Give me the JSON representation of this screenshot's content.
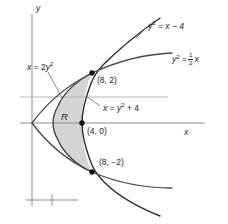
{
  "figure": {
    "type": "math-diagram",
    "background": "#ffffff",
    "shade_color": "#d4d4d4",
    "curve_color": "#3a3a3a",
    "axis_color": "#8c8c8c",
    "dot_color": "#111111"
  },
  "axes": {
    "x_label": "x",
    "y_label": "y",
    "x_axis_y": 123,
    "y_axis_x": 32,
    "gridline_y_2": 97
  },
  "labels": {
    "curve_left": {
      "lhs": "x",
      "eq": "=",
      "coef": "2",
      "var": "y",
      "exp": "2"
    },
    "curve_right": {
      "lhs": "x",
      "eq": "=",
      "var": "y",
      "exp": "2",
      "plus": "+ 4"
    },
    "curve_upper": {
      "var": "y",
      "exp": "2",
      "eq": "=",
      "rhs": "x − 4"
    },
    "curve_lower": {
      "var": "y",
      "exp": "2",
      "eq": "=",
      "num": "1",
      "den": "2",
      "rhs": "x"
    },
    "region": "R"
  },
  "points": [
    {
      "name": "point-8-2",
      "label": "(8, 2)",
      "x": 92,
      "y": 73
    },
    {
      "name": "point-4-0",
      "label": "(4, 0)",
      "x": 86,
      "y": 123
    },
    {
      "name": "point-8-minus2",
      "label": "(8, −2)",
      "x": 92,
      "y": 172
    }
  ],
  "scalebar": {
    "x1": 26,
    "x2": 78,
    "y": 200,
    "tick_x": 52
  }
}
